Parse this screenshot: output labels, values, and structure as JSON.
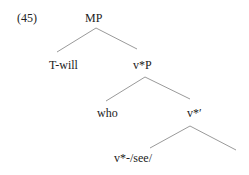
{
  "example_number": "(45)",
  "tree": {
    "root": "MP",
    "nodes": {
      "t_will": "T-will",
      "vstar_p": "v*P",
      "who": "who",
      "vstar_bar": "v*′",
      "vstar_see": "v*-/see/"
    }
  },
  "colors": {
    "line": "#9a9a9a",
    "text": "#222222"
  }
}
